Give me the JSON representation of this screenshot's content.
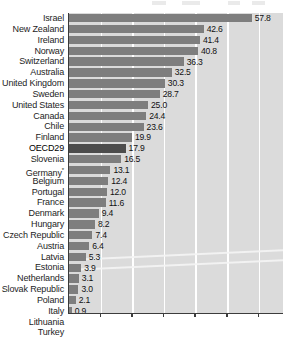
{
  "chart_data": {
    "type": "bar",
    "orientation": "horizontal",
    "title": "",
    "subtitle": "",
    "xlabel": "",
    "ylabel": "",
    "xlim": [
      0,
      68
    ],
    "grid": true,
    "gridlines": [
      10,
      20,
      30,
      40,
      50,
      60
    ],
    "tick_labels": [],
    "legend": [],
    "highlight_category": "OECD29",
    "categories": [
      "Israel",
      "New Zealand",
      "Ireland",
      "Norway",
      "Switzerland",
      "Australia",
      "United Kingdom",
      "Sweden",
      "United States",
      "Canada",
      "Chile",
      "Finland",
      "OECD29",
      "Slovenia",
      "Germany",
      "Belgium",
      "Portugal",
      "France",
      "Denmark",
      "Hungary",
      "Czech Republic",
      "Austria",
      "Latvia",
      "Estonia",
      "Netherlands",
      "Slovak Republic",
      "Poland",
      "Italy",
      "Lithuania",
      "Turkey"
    ],
    "values": [
      57.8,
      42.6,
      41.4,
      40.8,
      36.3,
      32.5,
      30.3,
      28.7,
      25.0,
      24.4,
      23.6,
      19.9,
      17.9,
      16.5,
      13.1,
      12.4,
      12.0,
      11.6,
      9.4,
      8.2,
      7.4,
      6.4,
      5.3,
      3.9,
      3.1,
      3.0,
      2.1,
      0.9,
      0.6,
      0.2
    ],
    "value_labels": [
      "57.8",
      "42.6",
      "41.4",
      "40.8",
      "36.3",
      "32.5",
      "30.3",
      "28.7",
      "25.0",
      "24.4",
      "23.6",
      "19.9",
      "17.9",
      "16.5",
      "13.1",
      "12.4",
      "12.0",
      "11.6",
      "9.4",
      "8.2",
      "7.4",
      "6.4",
      "5.3",
      "3.9",
      "3.1",
      "3.0",
      "2.1",
      "0.9",
      "0.6",
      "0.2"
    ],
    "footnote_markers": {
      "Germany": "*"
    },
    "colors": {
      "bar": "#7e7e7e",
      "bar_highlight": "#4c4c4c",
      "plot_background": "#dbdbdb",
      "gridline": "#ffffff",
      "axis": "#3c3c3c",
      "label_text": "#1d1d1d",
      "value_text": "#111111"
    }
  }
}
